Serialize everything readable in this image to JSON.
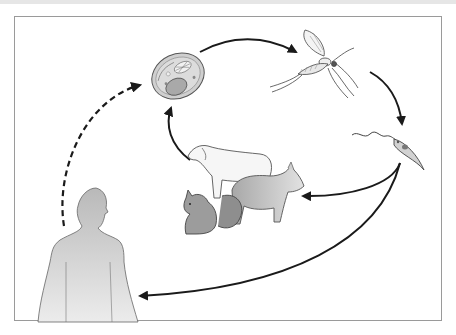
{
  "diagram": {
    "type": "life-cycle",
    "nodes": [
      {
        "id": "host-cell",
        "label": "",
        "depiction": "infected cell (macrophage with organelles)"
      },
      {
        "id": "sandfly",
        "label": "",
        "depiction": "sand fly / mosquito vector"
      },
      {
        "id": "promastigote",
        "label": "",
        "depiction": "flagellated parasite"
      },
      {
        "id": "reservoir-animals",
        "label": "",
        "depiction": "dog, fox, squirrel (animal reservoirs)"
      },
      {
        "id": "human",
        "label": "",
        "depiction": "human silhouette"
      }
    ],
    "edges": [
      {
        "from": "host-cell",
        "to": "sandfly",
        "style": "solid"
      },
      {
        "from": "sandfly",
        "to": "promastigote",
        "style": "solid"
      },
      {
        "from": "promastigote",
        "to": "reservoir-animals",
        "style": "solid"
      },
      {
        "from": "promastigote",
        "to": "human",
        "style": "solid"
      },
      {
        "from": "reservoir-animals",
        "to": "host-cell",
        "style": "solid"
      },
      {
        "from": "human",
        "to": "host-cell",
        "style": "dashed"
      }
    ],
    "colors": {
      "arrow": "#1a1a1a",
      "frame": "#9a9a9a",
      "fill_gray": "#bdbdbd",
      "fill_light": "#e4e4e4"
    }
  }
}
